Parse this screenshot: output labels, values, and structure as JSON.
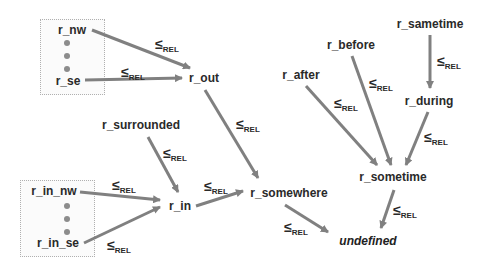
{
  "diagram": {
    "relation_symbol": "≤",
    "relation_subscript": "REL",
    "arrow_color": "#808080",
    "text_color": "#2a2a2a",
    "groups": [
      {
        "id": "outer-group",
        "members_label_top": "r_nw",
        "members_label_bottom": "r_se"
      },
      {
        "id": "inner-group",
        "members_label_top": "r_in_nw",
        "members_label_bottom": "r_in_se"
      }
    ],
    "nodes": {
      "r_nw": "r_nw",
      "r_se": "r_se",
      "r_out": "r_out",
      "r_surrounded": "r_surrounded",
      "r_in_nw": "r_in_nw",
      "r_in_se": "r_in_se",
      "r_in": "r_in",
      "r_somewhere": "r_somewhere",
      "undefined": "undefined",
      "r_sametime": "r_sametime",
      "r_before": "r_before",
      "r_after": "r_after",
      "r_during": "r_during",
      "r_sometime": "r_sometime"
    },
    "edges": [
      {
        "from": "r_nw",
        "to": "r_out",
        "label": "≤REL"
      },
      {
        "from": "r_se",
        "to": "r_out",
        "label": "≤REL"
      },
      {
        "from": "r_out",
        "to": "r_somewhere",
        "label": "≤REL"
      },
      {
        "from": "r_surrounded",
        "to": "r_in",
        "label": "≤REL"
      },
      {
        "from": "r_in_nw",
        "to": "r_in",
        "label": "≤REL"
      },
      {
        "from": "r_in_se",
        "to": "r_in",
        "label": "≤REL"
      },
      {
        "from": "r_in",
        "to": "r_somewhere",
        "label": "≤REL"
      },
      {
        "from": "r_somewhere",
        "to": "undefined",
        "label": "≤REL"
      },
      {
        "from": "r_sametime",
        "to": "r_during",
        "label": "≤REL"
      },
      {
        "from": "r_after",
        "to": "r_sometime",
        "label": "≤REL"
      },
      {
        "from": "r_before",
        "to": "r_sometime",
        "label": "≤REL"
      },
      {
        "from": "r_during",
        "to": "r_sometime",
        "label": "≤REL"
      },
      {
        "from": "r_sometime",
        "to": "undefined",
        "label": "≤REL"
      }
    ]
  }
}
